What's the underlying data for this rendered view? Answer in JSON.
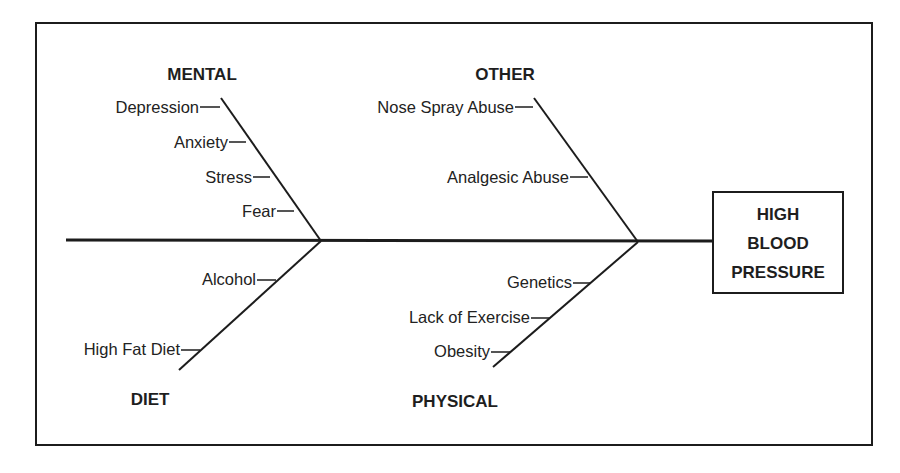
{
  "diagram": {
    "type": "fishbone",
    "effect": {
      "lines": [
        "HIGH",
        "BLOOD",
        "PRESSURE"
      ]
    },
    "categories": [
      {
        "name": "MENTAL",
        "position": "top-left",
        "causes": [
          "Depression",
          "Anxiety",
          "Stress",
          "Fear"
        ]
      },
      {
        "name": "OTHER",
        "position": "top-right",
        "causes": [
          "Nose Spray Abuse",
          "Analgesic Abuse"
        ]
      },
      {
        "name": "DIET",
        "position": "bottom-left",
        "causes": [
          "Alcohol",
          "High Fat Diet"
        ]
      },
      {
        "name": "PHYSICAL",
        "position": "bottom-right",
        "causes": [
          "Genetics",
          "Lack of Exercise",
          "Obesity"
        ]
      }
    ],
    "colors": {
      "line": "#1c1c1c",
      "text": "#222222",
      "background": "#ffffff"
    }
  }
}
